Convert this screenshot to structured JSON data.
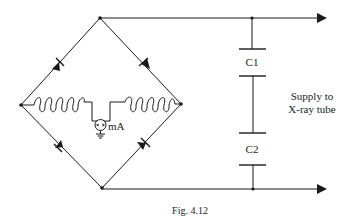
{
  "figure": {
    "caption": "Fig. 4.12",
    "components": {
      "capacitor_top": "C1",
      "capacitor_bottom": "C2",
      "meter": "mA"
    },
    "output_label": {
      "line1": "Supply to",
      "line2": "X-ray tube"
    },
    "elements": [
      "bridge-rectifier-4-diodes",
      "transformer-secondary-coils",
      "milliammeter-grounded",
      "capacitor-C1",
      "capacitor-C2",
      "output-arrows"
    ]
  }
}
